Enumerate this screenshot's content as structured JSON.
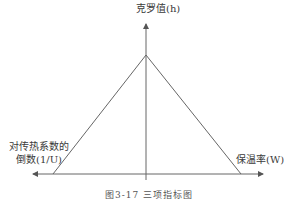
{
  "diagram": {
    "type": "triangle-tradeoff",
    "y_axis_label": "克罗值(h)",
    "left_axis_label_line1": "对传热系数的",
    "left_axis_label_line2": "倒数(1/U)",
    "right_axis_label": "保温率(W)",
    "caption": "图3-17  三项指标图",
    "line_color": "#555555",
    "background": "#ffffff"
  }
}
